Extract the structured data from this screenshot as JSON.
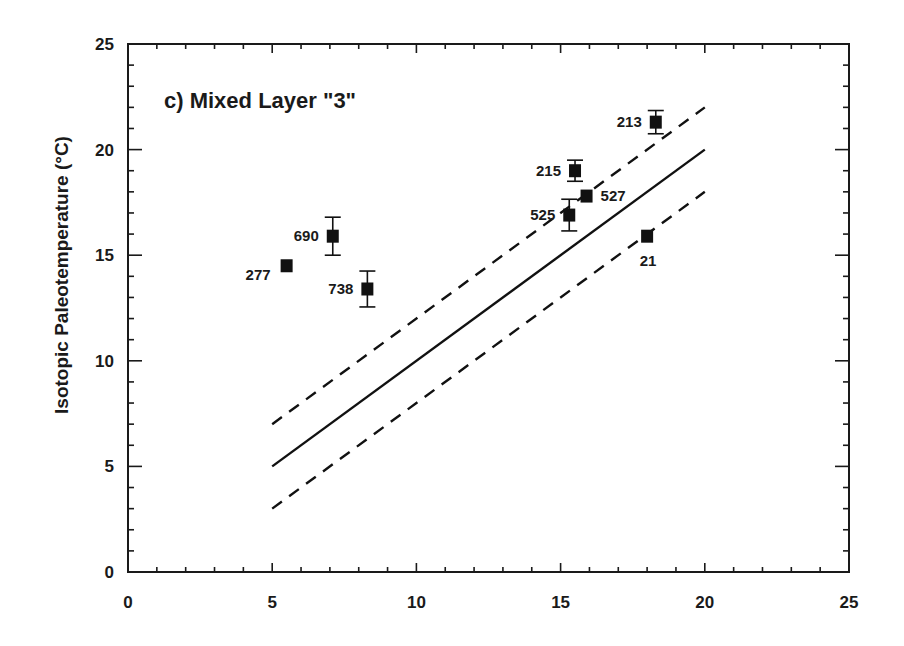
{
  "chart_data": {
    "type": "scatter",
    "title": "c) Mixed Layer \"3\"",
    "xlabel": "",
    "ylabel": "Isotopic Paleotemperature (°C)",
    "xlim": [
      0,
      25
    ],
    "ylim": [
      0,
      25
    ],
    "x_major_ticks": [
      0,
      5,
      10,
      15,
      20,
      25
    ],
    "y_major_ticks": [
      0,
      5,
      10,
      15,
      20,
      25
    ],
    "x_tick_labels": [
      "0",
      "5",
      "10",
      "15",
      "20",
      "25"
    ],
    "y_tick_labels": [
      "0",
      "5",
      "10",
      "15",
      "20",
      "25"
    ],
    "minor_tick_step": 1,
    "grid": false,
    "legend": null,
    "series": [
      {
        "name": "sites",
        "marker": "filled-square",
        "points": [
          {
            "label": "277",
            "x": 5.5,
            "y": 14.5,
            "yerr": 0,
            "label_pos": "left-below"
          },
          {
            "label": "690",
            "x": 7.1,
            "y": 15.9,
            "yerr": 0.9,
            "label_pos": "left"
          },
          {
            "label": "738",
            "x": 8.3,
            "y": 13.4,
            "yerr": 0.85,
            "label_pos": "left"
          },
          {
            "label": "215",
            "x": 15.5,
            "y": 19.0,
            "yerr": 0.5,
            "label_pos": "left"
          },
          {
            "label": "527",
            "x": 15.9,
            "y": 17.8,
            "yerr": 0,
            "label_pos": "right"
          },
          {
            "label": "525",
            "x": 15.3,
            "y": 16.9,
            "yerr": 0.75,
            "label_pos": "left"
          },
          {
            "label": "213",
            "x": 18.3,
            "y": 21.3,
            "yerr": 0.55,
            "label_pos": "left"
          },
          {
            "label": "21",
            "x": 18.0,
            "y": 15.9,
            "yerr": 0,
            "label_pos": "below"
          }
        ]
      }
    ],
    "lines": [
      {
        "name": "1:1 line",
        "style": "solid",
        "x": [
          5,
          20
        ],
        "y": [
          5,
          20
        ]
      },
      {
        "name": "upper bound (+2)",
        "style": "dashed",
        "x": [
          5,
          20
        ],
        "y": [
          7,
          22
        ]
      },
      {
        "name": "lower bound (-2)",
        "style": "dashed",
        "x": [
          5,
          20
        ],
        "y": [
          3,
          18
        ]
      }
    ]
  },
  "layout": {
    "plot_left": 128,
    "plot_right": 849,
    "plot_top": 44,
    "plot_bottom": 572
  }
}
